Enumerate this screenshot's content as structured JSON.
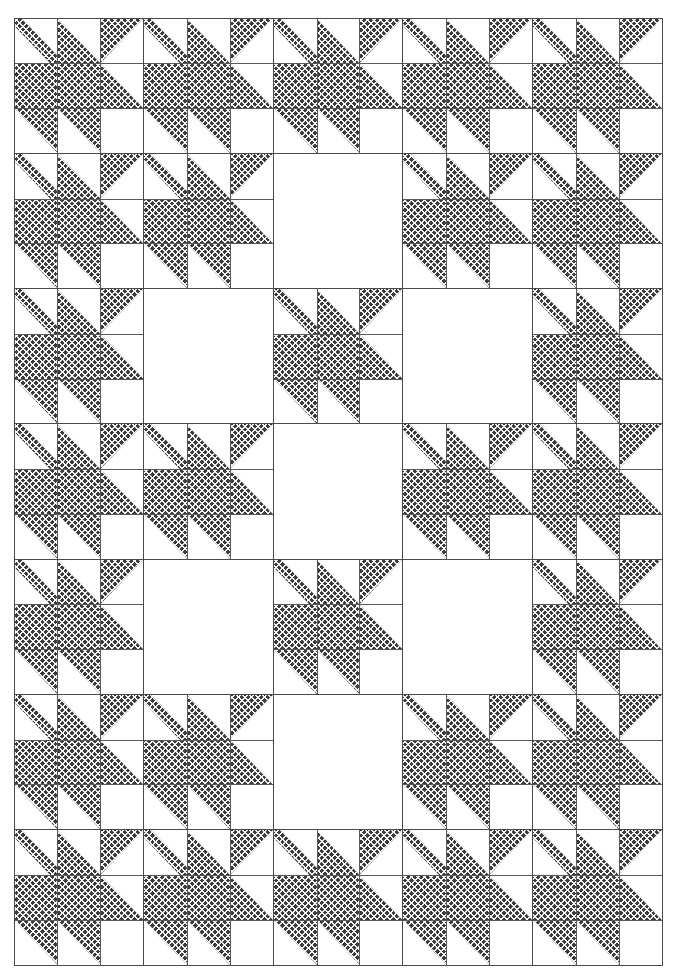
{
  "artwork": {
    "title": "Pieced Quilt Pattern Diagram",
    "kind": "quilt-block-layout",
    "background_color": "#ffffff",
    "ink_color": "#3d3d3d",
    "seam_line_color": "#4a4a4a",
    "grid": {
      "columns": 5,
      "rows": 7,
      "block_subdivision": 3,
      "left_px": 14,
      "top_px": 18,
      "width_px": 648,
      "height_px": 947
    },
    "patch_legend": {
      "t-none": "plain white patch",
      "t-full": "solid cross-hatched patch",
      "t-ul": "cross-hatched upper-left half-square triangle",
      "t-ur": "cross-hatched upper-right half-square triangle",
      "t-ll": "cross-hatched lower-left half-square triangle",
      "t-lr": "cross-hatched lower-right half-square triangle",
      "t-diag": "thin cross-hatched diagonal sliver, top-left to bottom-right"
    },
    "block_pattern": [
      [
        "t-diag",
        "t-ll",
        "t-ul"
      ],
      [
        "t-full",
        "t-full",
        "t-ll"
      ],
      [
        "t-ur",
        "t-ur",
        "t-none"
      ]
    ],
    "layout": [
      [
        "block",
        "block",
        "block",
        "block",
        "block"
      ],
      [
        "block",
        "block",
        "blank",
        "block",
        "block"
      ],
      [
        "block",
        "blank",
        "block",
        "blank",
        "block"
      ],
      [
        "block",
        "block",
        "blank",
        "block",
        "block"
      ],
      [
        "block",
        "blank",
        "block",
        "blank",
        "block"
      ],
      [
        "block",
        "block",
        "blank",
        "block",
        "block"
      ],
      [
        "block",
        "block",
        "block",
        "block",
        "block"
      ]
    ],
    "counts": {
      "total_cells": 35,
      "pieced_blocks": 27,
      "blank_blocks": 8
    }
  }
}
